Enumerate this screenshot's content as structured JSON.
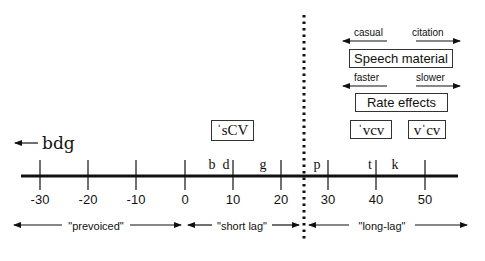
{
  "axis": {
    "title": "",
    "ticks": [
      {
        "value": -30,
        "label": "-30",
        "x": 40
      },
      {
        "value": -20,
        "label": "-20",
        "x": 88
      },
      {
        "value": -10,
        "label": "-10",
        "x": 136
      },
      {
        "value": 0,
        "label": "0",
        "x": 185
      },
      {
        "value": 10,
        "label": "10",
        "x": 233
      },
      {
        "value": 20,
        "label": "20",
        "x": 281
      },
      {
        "value": 30,
        "label": "30",
        "x": 328
      },
      {
        "value": 40,
        "label": "40",
        "x": 376
      },
      {
        "value": 50,
        "label": "50",
        "x": 425
      }
    ]
  },
  "consonants": {
    "b": "b",
    "d": "d",
    "g": "g",
    "p": "p",
    "t": "t",
    "k": "k"
  },
  "bdg_arrow_label": "bdg",
  "ranges": {
    "prevoiced": "\"prevoiced\"",
    "short_lag": "\"short lag\"",
    "long_lag": "\"long-lag\""
  },
  "boxes": {
    "scv": "ˈsCV",
    "vcv_initial_stress": "ˈvcv",
    "vcv_medial_stress": "vˈcv",
    "speech_material": "Speech material",
    "rate_effects": "Rate effects"
  },
  "legend_arrows": {
    "speech_left": "casual",
    "speech_right": "citation",
    "rate_left": "faster",
    "rate_right": "slower"
  },
  "colors": {
    "ink": "#111111",
    "background": "#ffffff"
  }
}
